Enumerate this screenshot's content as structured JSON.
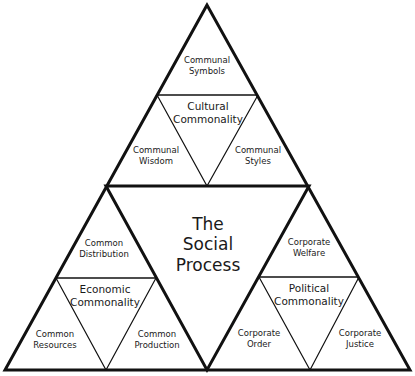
{
  "center": {
    "lines": [
      "The",
      "Social",
      "Process"
    ]
  },
  "top": {
    "core": [
      "Cultural",
      "Commonality"
    ],
    "apex": [
      "Communal",
      "Symbols"
    ],
    "left": [
      "Communal",
      "Wisdom"
    ],
    "right": [
      "Communal",
      "Styles"
    ]
  },
  "left": {
    "core": [
      "Economic",
      "Commonality"
    ],
    "apex": [
      "Common",
      "Distribution"
    ],
    "left": [
      "Common",
      "Resources"
    ],
    "right": [
      "Common",
      "Production"
    ]
  },
  "right": {
    "core": [
      "Political",
      "Commonality"
    ],
    "apex": [
      "Corporate",
      "Welfare"
    ],
    "left": [
      "Corporate",
      "Order"
    ],
    "right": [
      "Corporate",
      "Justice"
    ]
  },
  "colors": {
    "stroke": "#111111",
    "background": "#ffffff"
  }
}
